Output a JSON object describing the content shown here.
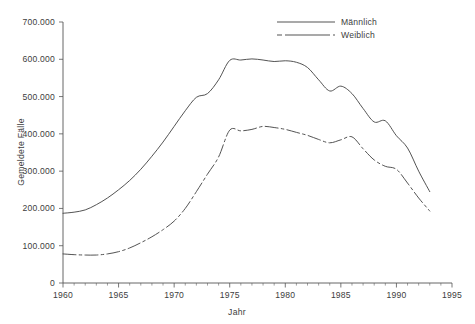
{
  "chart_data": {
    "type": "line",
    "title": "",
    "xlabel": "Jahr",
    "ylabel": "Gemeldete Fälle",
    "xlim": [
      1960,
      1995
    ],
    "ylim": [
      0,
      700000
    ],
    "grid": false,
    "legend_position": "top-right",
    "x": [
      1960,
      1961,
      1962,
      1963,
      1964,
      1965,
      1966,
      1967,
      1968,
      1969,
      1970,
      1971,
      1972,
      1973,
      1974,
      1975,
      1976,
      1977,
      1978,
      1979,
      1980,
      1981,
      1982,
      1983,
      1984,
      1985,
      1986,
      1987,
      1988,
      1989,
      1990,
      1991,
      1992,
      1993
    ],
    "xticks": [
      1960,
      1965,
      1970,
      1975,
      1980,
      1985,
      1990,
      1995
    ],
    "xticklabels": [
      "1960",
      "1965",
      "1970",
      "1975",
      "1980",
      "1985",
      "1990",
      "1995"
    ],
    "yticks": [
      0,
      100000,
      200000,
      300000,
      400000,
      500000,
      600000,
      700000
    ],
    "yticklabels": [
      "0",
      "100.000",
      "200.000",
      "300.000",
      "400.000",
      "500.000",
      "600.000",
      "700.000"
    ],
    "series": [
      {
        "name": "Männlich",
        "style": "solid",
        "color": "#4a4a4a",
        "values": [
          187000,
          190000,
          196000,
          210000,
          228000,
          250000,
          275000,
          305000,
          340000,
          378000,
          420000,
          462000,
          498000,
          508000,
          545000,
          597000,
          598000,
          601000,
          598000,
          594000,
          596000,
          592000,
          578000,
          545000,
          515000,
          528000,
          508000,
          468000,
          432000,
          435000,
          395000,
          362000,
          300000,
          245000
        ]
      },
      {
        "name": "Weiblich",
        "style": "dashed",
        "color": "#4a4a4a",
        "values": [
          78000,
          76000,
          75000,
          75000,
          78000,
          84000,
          94000,
          108000,
          124000,
          143000,
          166000,
          200000,
          245000,
          292000,
          338000,
          410000,
          408000,
          412000,
          420000,
          417000,
          412000,
          404000,
          396000,
          385000,
          376000,
          384000,
          392000,
          360000,
          330000,
          313000,
          305000,
          268000,
          228000,
          193000
        ]
      }
    ]
  },
  "legend": {
    "items": [
      {
        "label": "Männlich",
        "style": "solid"
      },
      {
        "label": "Weiblich",
        "style": "dashed"
      }
    ]
  },
  "axes": {
    "x_title": "Jahr",
    "y_title": "Gemeldete Fälle"
  }
}
